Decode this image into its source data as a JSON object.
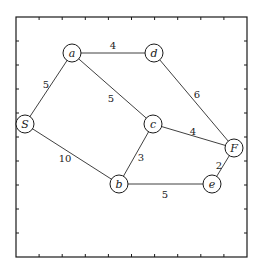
{
  "diagram": {
    "type": "weighted-undirected-graph",
    "frame": {
      "left": 16,
      "top": 17,
      "right": 247,
      "bottom": 257,
      "tick_count_per_side": 9
    },
    "colors": {
      "line": "#1a1a1a",
      "background": "#ffffff"
    },
    "nodes": [
      {
        "id": "a",
        "label": "a",
        "x": 72,
        "y": 53
      },
      {
        "id": "d",
        "label": "d",
        "x": 154,
        "y": 53
      },
      {
        "id": "S",
        "label": "S",
        "x": 25,
        "y": 124
      },
      {
        "id": "c",
        "label": "c",
        "x": 153,
        "y": 124
      },
      {
        "id": "F",
        "label": "F",
        "x": 234,
        "y": 148
      },
      {
        "id": "b",
        "label": "b",
        "x": 119,
        "y": 184
      },
      {
        "id": "e",
        "label": "e",
        "x": 212,
        "y": 184
      }
    ],
    "edges": [
      {
        "from": "a",
        "to": "d",
        "weight": "4",
        "lx": 113,
        "ly": 45
      },
      {
        "from": "a",
        "to": "S",
        "weight": "5",
        "lx": 46,
        "ly": 84
      },
      {
        "from": "a",
        "to": "c",
        "weight": "5",
        "lx": 111,
        "ly": 98
      },
      {
        "from": "d",
        "to": "F",
        "weight": "6",
        "lx": 197,
        "ly": 94
      },
      {
        "from": "c",
        "to": "F",
        "weight": "4",
        "lx": 193,
        "ly": 131
      },
      {
        "from": "S",
        "to": "b",
        "weight": "10",
        "lx": 65,
        "ly": 158
      },
      {
        "from": "c",
        "to": "b",
        "weight": "3",
        "lx": 141,
        "ly": 157
      },
      {
        "from": "b",
        "to": "e",
        "weight": "5",
        "lx": 165,
        "ly": 194
      },
      {
        "from": "F",
        "to": "e",
        "weight": "2",
        "lx": 219,
        "ly": 165
      }
    ],
    "node_radius": 9
  }
}
